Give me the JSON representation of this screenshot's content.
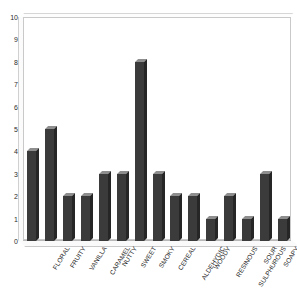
{
  "chart_data": {
    "type": "bar",
    "title": "",
    "xlabel": "",
    "ylabel": "",
    "ylim": [
      0,
      10
    ],
    "ytick_step": 1,
    "yticks": [
      0,
      1,
      2,
      3,
      4,
      5,
      6,
      7,
      8,
      9,
      10
    ],
    "grid": false,
    "legend": null,
    "categories": [
      "FLORAL",
      "FRUITY",
      "VANILLA",
      "CARAMEL",
      "NUTTY",
      "SWEET",
      "SMOKY",
      "CEREAL",
      "ALDEHYDIC",
      "WOODY",
      "RESINOUS",
      "SULPHUROUS",
      "SOUR",
      "SOAPY",
      "MUSTY"
    ],
    "values": [
      4,
      5,
      2,
      2,
      3,
      3,
      8,
      3,
      2,
      2,
      1,
      2,
      1,
      3,
      1
    ],
    "bar_color": "#3b3b3b",
    "plot_border_color": "#c9c9c9",
    "axis_color": "#b8b8b8",
    "text_color": "#1f1f1f"
  }
}
